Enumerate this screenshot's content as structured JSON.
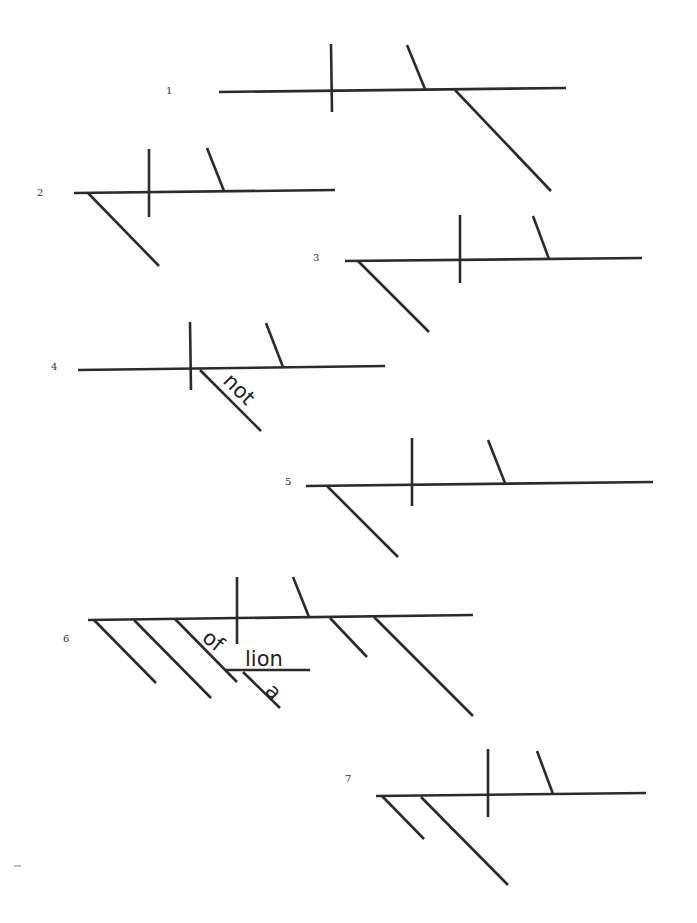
{
  "page": {
    "background": "#ffffff",
    "line_color": "#2b2b2b"
  },
  "diagrams": [
    {
      "number": "1",
      "label_pos": [
        166,
        94
      ],
      "lines": [
        [
          219,
          92,
          566,
          88
        ],
        [
          331,
          44,
          332,
          112
        ],
        [
          407,
          45,
          425,
          89
        ],
        [
          455,
          90,
          551,
          191
        ]
      ],
      "words": []
    },
    {
      "number": "2",
      "label_pos": [
        37,
        196
      ],
      "lines": [
        [
          74,
          193,
          335,
          190
        ],
        [
          149,
          149,
          149,
          217
        ],
        [
          207,
          148,
          224,
          191
        ],
        [
          88,
          193,
          159,
          266
        ]
      ],
      "words": []
    },
    {
      "number": "3",
      "label_pos": [
        313,
        261
      ],
      "lines": [
        [
          345,
          261,
          642,
          258
        ],
        [
          460,
          215,
          460,
          283
        ],
        [
          533,
          216,
          549,
          259
        ],
        [
          358,
          261,
          429,
          332
        ]
      ],
      "words": []
    },
    {
      "number": "4",
      "label_pos": [
        51,
        370
      ],
      "lines": [
        [
          78,
          370,
          385,
          366
        ],
        [
          190,
          322,
          191,
          390
        ],
        [
          266,
          323,
          283,
          367
        ],
        [
          200,
          370,
          261,
          431
        ]
      ],
      "words": [
        {
          "text": "not",
          "x": 222,
          "y": 382,
          "rotate": 45
        }
      ]
    },
    {
      "number": "5",
      "label_pos": [
        285,
        485
      ],
      "lines": [
        [
          306,
          486,
          653,
          482
        ],
        [
          412,
          438,
          412,
          506
        ],
        [
          488,
          440,
          505,
          483
        ],
        [
          327,
          486,
          398,
          557
        ]
      ],
      "words": []
    },
    {
      "number": "6",
      "label_pos": [
        63,
        642
      ],
      "lines": [
        [
          88,
          620,
          473,
          615
        ],
        [
          237,
          577,
          237,
          644
        ],
        [
          293,
          577,
          309,
          617
        ],
        [
          94,
          620,
          156,
          683
        ],
        [
          134,
          620,
          211,
          698
        ],
        [
          175,
          619,
          237,
          682
        ],
        [
          226,
          670,
          310,
          670
        ],
        [
          243,
          672,
          280,
          708
        ],
        [
          330,
          618,
          367,
          657
        ],
        [
          374,
          617,
          473,
          716
        ]
      ],
      "words": [
        {
          "text": "of",
          "x": 201,
          "y": 640,
          "rotate": 38
        },
        {
          "text": "lion",
          "x": 245,
          "y": 666,
          "rotate": 0
        },
        {
          "text": "a",
          "x": 264,
          "y": 692,
          "rotate": 45
        }
      ]
    },
    {
      "number": "7",
      "label_pos": [
        345,
        782
      ],
      "lines": [
        [
          376,
          796,
          646,
          793
        ],
        [
          488,
          749,
          488,
          817
        ],
        [
          537,
          751,
          553,
          794
        ],
        [
          382,
          796,
          424,
          839
        ],
        [
          421,
          797,
          508,
          885
        ]
      ],
      "words": []
    }
  ]
}
